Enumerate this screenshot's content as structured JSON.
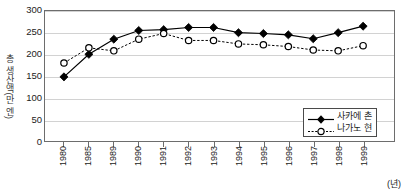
{
  "chart_data": {
    "type": "line",
    "title": "",
    "xlabel": "(년)",
    "ylabel": "총 생산액(만 엔)",
    "categories": [
      "1980",
      "1985",
      "1989",
      "1990",
      "1991",
      "1992",
      "1993",
      "1994",
      "1995",
      "1996",
      "1997",
      "1998",
      "1999"
    ],
    "ylim": [
      0,
      300
    ],
    "yticks": [
      0,
      50,
      100,
      150,
      200,
      250,
      300
    ],
    "grid": true,
    "legend_position": "bottom-right",
    "series": [
      {
        "name": "사카에 촌",
        "marker": "filled-diamond",
        "line": "solid",
        "color": "#000000",
        "values": [
          148,
          200,
          235,
          255,
          257,
          262,
          262,
          250,
          248,
          245,
          236,
          250,
          265
        ]
      },
      {
        "name": "나가노 현",
        "marker": "open-circle",
        "line": "dashed",
        "color": "#000000",
        "values": [
          180,
          215,
          208,
          235,
          248,
          232,
          232,
          224,
          222,
          218,
          210,
          208,
          220
        ]
      }
    ]
  },
  "legend": {
    "items": [
      {
        "label": "사카에 촌"
      },
      {
        "label": "나가노 현"
      }
    ]
  },
  "axis": {
    "y_title": "총 생산액(만 엔)",
    "x_unit": "(년)"
  }
}
